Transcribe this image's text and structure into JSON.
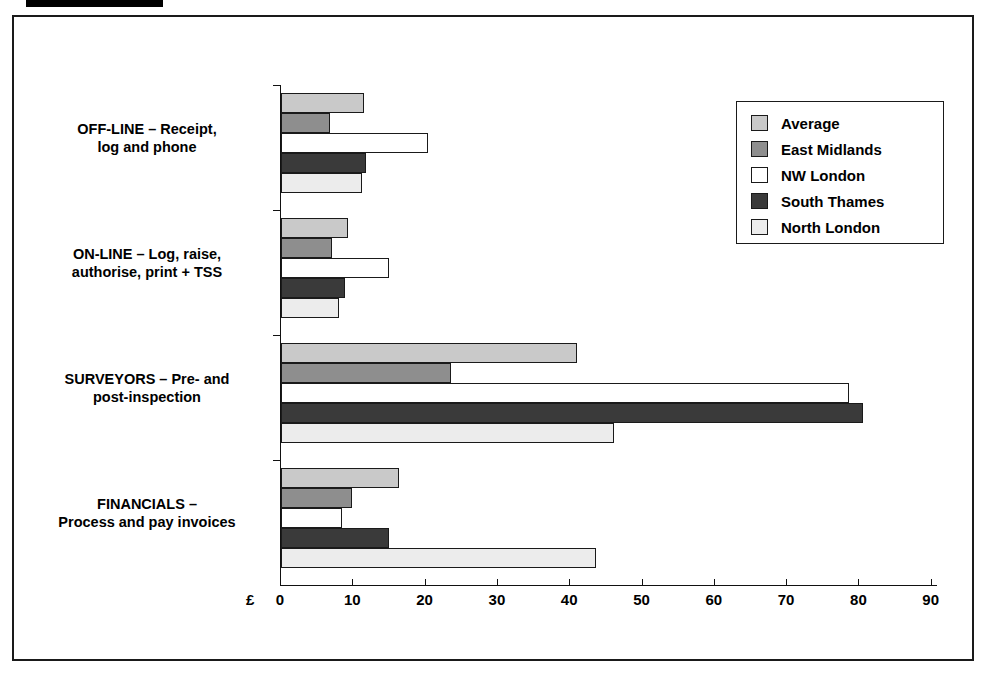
{
  "redaction": {
    "name": "redaction-bar"
  },
  "header": {
    "ghost_text": ""
  },
  "chart_data": {
    "type": "bar",
    "orientation": "horizontal",
    "title": "",
    "xlabel": "£",
    "ylabel": "",
    "xlim": [
      0,
      90
    ],
    "xticks": [
      0,
      10,
      20,
      30,
      40,
      50,
      60,
      70,
      80,
      90
    ],
    "xtick_labels": [
      "0",
      "10",
      "20",
      "30",
      "40",
      "50",
      "60",
      "70",
      "80",
      "90"
    ],
    "grid": false,
    "legend_position": "top-right",
    "categories": [
      "OFF-LINE – Receipt,\nlog and phone",
      "ON-LINE – Log, raise,\nauthorise, print + TSS",
      "SURVEYORS – Pre- and\npost-inspection",
      "FINANCIALS –\nProcess and pay invoices"
    ],
    "category_lines": [
      [
        "OFF-LINE – Receipt,",
        "log and phone"
      ],
      [
        "ON-LINE – Log, raise,",
        "authorise, print + TSS"
      ],
      [
        "SURVEYORS – Pre- and",
        "post-inspection"
      ],
      [
        "FINANCIALS –",
        "Process and pay invoices"
      ]
    ],
    "series": [
      {
        "name": "Average",
        "key": "average",
        "color": "#c9c9c9",
        "values": [
          11.5,
          9.3,
          41.0,
          16.3
        ]
      },
      {
        "name": "East Midlands",
        "key": "east",
        "color": "#8e8e8e",
        "values": [
          6.8,
          7.0,
          23.5,
          9.8
        ]
      },
      {
        "name": "NW London",
        "key": "nwlondon",
        "color": "#ffffff",
        "values": [
          20.3,
          15.0,
          78.5,
          8.5
        ]
      },
      {
        "name": "South Thames",
        "key": "souththames",
        "color": "#3a3a3a",
        "values": [
          11.7,
          8.8,
          80.5,
          15.0
        ]
      },
      {
        "name": "North London",
        "key": "northlondon",
        "color": "#ececec",
        "values": [
          11.2,
          8.0,
          46.0,
          43.5
        ]
      }
    ]
  },
  "legend": {
    "items": [
      {
        "label": "Average",
        "color": "#c9c9c9"
      },
      {
        "label": "East Midlands",
        "color": "#8e8e8e"
      },
      {
        "label": "NW London",
        "color": "#ffffff"
      },
      {
        "label": "South Thames",
        "color": "#3a3a3a"
      },
      {
        "label": "North London",
        "color": "#ececec"
      }
    ]
  }
}
